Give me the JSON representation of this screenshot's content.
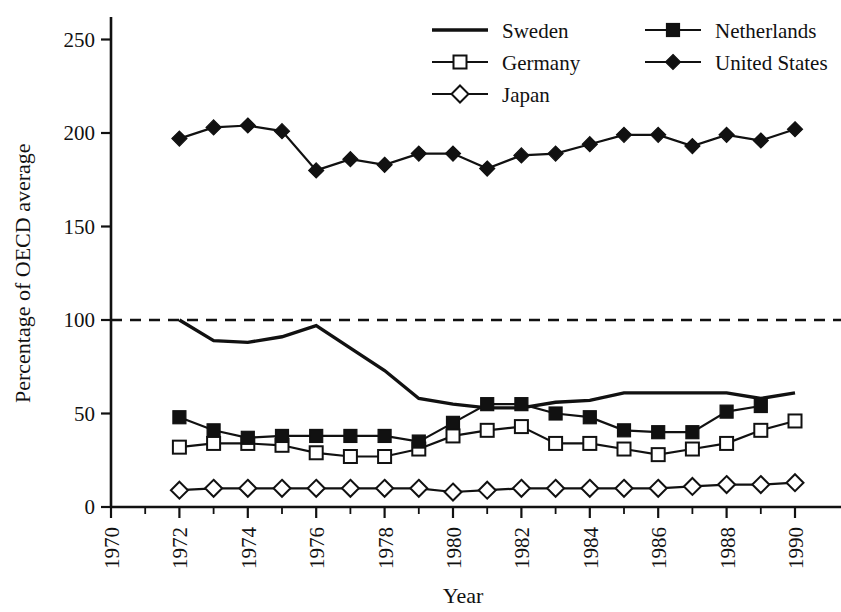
{
  "chart_data": {
    "type": "line",
    "title": "",
    "xlabel": "Year",
    "ylabel": "Percentage of OECD average",
    "xlim": [
      1970,
      1991
    ],
    "ylim": [
      0,
      262
    ],
    "xticks": [
      1970,
      1972,
      1974,
      1976,
      1978,
      1980,
      1982,
      1984,
      1986,
      1988,
      1990
    ],
    "xtick_labels": [
      "1970",
      "1972",
      "1974",
      "1976",
      "1978",
      "1980",
      "1982",
      "1984",
      "1986",
      "1988",
      "1990"
    ],
    "xminor_ticks": [
      1971,
      1973,
      1975,
      1977,
      1979,
      1981,
      1983,
      1985,
      1987,
      1989
    ],
    "yticks": [
      0,
      50,
      100,
      150,
      200,
      250
    ],
    "ytick_labels": [
      "0",
      "50",
      "100",
      "150",
      "200",
      "250"
    ],
    "grid": false,
    "reference_line": {
      "value": 100,
      "style": "dashed",
      "label": ""
    },
    "legend_position": "top-right",
    "series": [
      {
        "name": "Sweden",
        "marker": "none",
        "color": "#111111",
        "x": [
          1972,
          1973,
          1974,
          1975,
          1976,
          1977,
          1978,
          1979,
          1980,
          1981,
          1982,
          1983,
          1984,
          1985,
          1986,
          1987,
          1988,
          1989,
          1990
        ],
        "values": [
          100,
          89,
          88,
          91,
          97,
          85,
          73,
          58,
          55,
          53,
          53,
          56,
          57,
          61,
          61,
          61,
          61,
          58,
          61
        ]
      },
      {
        "name": "Germany",
        "marker": "open-square",
        "color": "#111111",
        "x": [
          1972,
          1973,
          1974,
          1975,
          1976,
          1977,
          1978,
          1979,
          1980,
          1981,
          1982,
          1983,
          1984,
          1985,
          1986,
          1987,
          1988,
          1989,
          1990
        ],
        "values": [
          32,
          34,
          34,
          33,
          29,
          27,
          27,
          31,
          38,
          41,
          43,
          34,
          34,
          31,
          28,
          31,
          34,
          41,
          46
        ]
      },
      {
        "name": "Japan",
        "marker": "open-diamond",
        "color": "#111111",
        "x": [
          1972,
          1973,
          1974,
          1975,
          1976,
          1977,
          1978,
          1979,
          1980,
          1981,
          1982,
          1983,
          1984,
          1985,
          1986,
          1987,
          1988,
          1989,
          1990
        ],
        "values": [
          9,
          10,
          10,
          10,
          10,
          10,
          10,
          10,
          8,
          9,
          10,
          10,
          10,
          10,
          10,
          11,
          12,
          12,
          13
        ]
      },
      {
        "name": "Netherlands",
        "marker": "filled-square",
        "color": "#111111",
        "x": [
          1972,
          1973,
          1974,
          1975,
          1976,
          1977,
          1978,
          1979,
          1980,
          1981,
          1982,
          1983,
          1984,
          1985,
          1986,
          1987,
          1988,
          1989
        ],
        "values": [
          48,
          41,
          37,
          38,
          38,
          38,
          38,
          35,
          45,
          55,
          55,
          50,
          48,
          41,
          40,
          40,
          51,
          54
        ]
      },
      {
        "name": "United States",
        "marker": "filled-diamond",
        "color": "#111111",
        "x": [
          1972,
          1973,
          1974,
          1975,
          1976,
          1977,
          1978,
          1979,
          1980,
          1981,
          1982,
          1983,
          1984,
          1985,
          1986,
          1987,
          1988,
          1989,
          1990
        ],
        "values": [
          197,
          203,
          204,
          201,
          180,
          186,
          183,
          189,
          189,
          181,
          188,
          189,
          194,
          199,
          199,
          193,
          199,
          196,
          202
        ]
      }
    ]
  },
  "legend": {
    "entries": [
      {
        "label": "Sweden",
        "marker": "none"
      },
      {
        "label": "Netherlands",
        "marker": "filled-square"
      },
      {
        "label": "Germany",
        "marker": "open-square"
      },
      {
        "label": "United States",
        "marker": "filled-diamond"
      },
      {
        "label": "Japan",
        "marker": "open-diamond"
      }
    ]
  },
  "axes": {
    "x_title": "Year",
    "y_title": "Percentage of OECD average"
  }
}
